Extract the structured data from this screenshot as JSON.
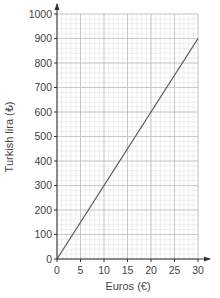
{
  "chart_data": {
    "type": "line",
    "title": "",
    "xlabel": "Euros (€)",
    "ylabel": "Turkish lira (₺)",
    "xlim": [
      0,
      30
    ],
    "ylim": [
      0,
      1000
    ],
    "x_ticks": [
      0,
      5,
      10,
      15,
      20,
      25,
      30
    ],
    "y_ticks": [
      0,
      100,
      200,
      300,
      400,
      500,
      600,
      700,
      800,
      900,
      1000
    ],
    "grid": true,
    "grid_minor_x_step": 1,
    "grid_minor_y_step": 20,
    "series": [
      {
        "name": "Conversion line",
        "x": [
          0,
          30
        ],
        "y": [
          0,
          900
        ]
      }
    ],
    "legend": null
  },
  "colors": {
    "grid_major": "#b8b8b8",
    "grid_minor": "#dedede",
    "axis": "#333333",
    "line": "#555555"
  }
}
